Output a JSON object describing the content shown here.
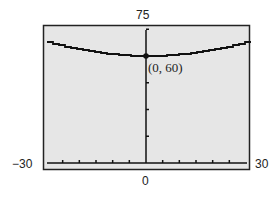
{
  "chart_data": {
    "type": "line",
    "title": "",
    "xlabel": "",
    "ylabel": "",
    "xlim": [
      -30,
      30
    ],
    "ylim": [
      0,
      75
    ],
    "x_tick_step": 5,
    "y_tick_step": 15,
    "window_labels": {
      "ymax": "75",
      "xmin": "−30",
      "xmax": "30",
      "ymin": "0"
    },
    "series": [
      {
        "name": "curve",
        "x": [
          -29,
          -20,
          -10,
          0,
          10,
          20,
          29
        ],
        "y": [
          67.5,
          63.5,
          61,
          60,
          61,
          63.5,
          67.5
        ]
      }
    ],
    "annotations": [
      {
        "x": 0,
        "y": 60,
        "text": "(0, 60)"
      }
    ],
    "grid": false,
    "background": "#e6e6e6",
    "line_color": "#111111"
  }
}
